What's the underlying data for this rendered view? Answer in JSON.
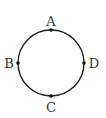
{
  "diagram": {
    "type": "circle-with-points",
    "circle": {
      "cx": 51,
      "cy": 63,
      "r": 33,
      "stroke": "#222222"
    },
    "points": [
      {
        "label": "A",
        "position": "top"
      },
      {
        "label": "B",
        "position": "left"
      },
      {
        "label": "C",
        "position": "bottom"
      },
      {
        "label": "D",
        "position": "right"
      }
    ]
  }
}
